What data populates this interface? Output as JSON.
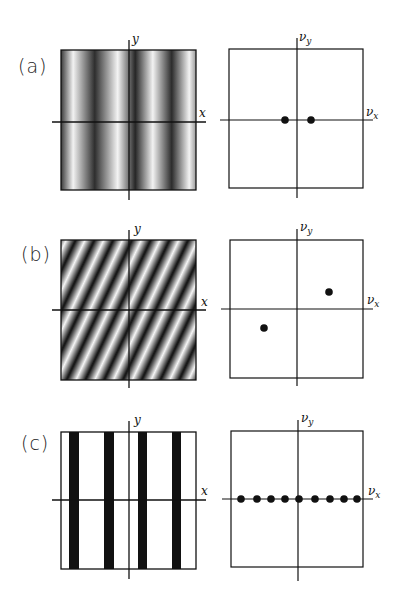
{
  "panels": [
    {
      "id": "a",
      "label": "(a)",
      "space": {
        "x_label": "x",
        "y_label": "y",
        "pattern": "sinusoidal-vertical-gray"
      },
      "freq": {
        "x_label": "ν",
        "x_sub": "x",
        "y_label": "ν",
        "y_sub": "y",
        "dots": [
          [
            -1,
            0
          ],
          [
            1,
            0
          ]
        ]
      }
    },
    {
      "id": "b",
      "label": "(b)",
      "space": {
        "x_label": "x",
        "y_label": "y",
        "pattern": "sinusoidal-diagonal"
      },
      "freq": {
        "x_label": "ν",
        "x_sub": "x",
        "y_label": "ν",
        "y_sub": "y",
        "dots": [
          [
            2.4,
            1.3
          ],
          [
            -2.4,
            -1.3
          ]
        ]
      }
    },
    {
      "id": "c",
      "label": "(c)",
      "space": {
        "x_label": "x",
        "y_label": "y",
        "pattern": "square-wave-vertical-bars"
      },
      "freq": {
        "x_label": "ν",
        "x_sub": "x",
        "y_label": "ν",
        "y_sub": "y",
        "dots": [
          [
            -4,
            0
          ],
          [
            -3,
            0
          ],
          [
            -2,
            0
          ],
          [
            -1,
            0
          ],
          [
            0,
            0
          ],
          [
            1,
            0
          ],
          [
            2,
            0
          ],
          [
            3,
            0
          ],
          [
            4,
            0
          ]
        ]
      }
    }
  ],
  "colors": {
    "ink": "#111111",
    "background": "#ffffff"
  }
}
